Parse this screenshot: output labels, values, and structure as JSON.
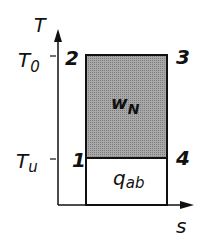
{
  "diagram": {
    "type": "T-s diagram (Carnot cycle)",
    "axes": {
      "y_label": "T",
      "x_label": "s"
    },
    "levels": {
      "upper": "T",
      "upper_sub": "0",
      "lower": "T",
      "lower_sub": "u"
    },
    "points": {
      "p1": "1",
      "p2": "2",
      "p3": "3",
      "p4": "4"
    },
    "areas": {
      "work": "w",
      "work_sub": "N",
      "heat": "q",
      "heat_sub": "ab"
    },
    "colors": {
      "line": "#111111",
      "work_fill": "#9a9a9a",
      "heat_fill": "#ffffff",
      "background": "#ffffff"
    }
  }
}
